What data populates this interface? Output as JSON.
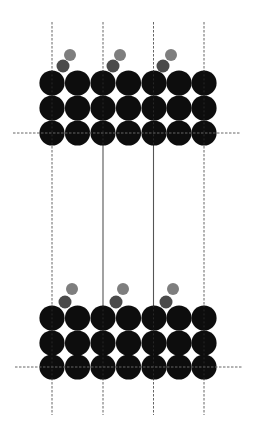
{
  "diagram": {
    "title": "",
    "colors": {
      "background": "#ffffff",
      "substrate_atom": "#0d0d0d",
      "adsorbate_lower": "#4a4a4a",
      "adsorbate_upper": "#7e7e7e",
      "solid_line": "#555555",
      "dashed_line": "#666666"
    },
    "grid": {
      "columns_x": [
        52,
        77.5,
        103,
        128.5,
        154,
        179,
        204
      ],
      "atom_radius": 12.6
    },
    "slabs": [
      {
        "name": "top-slab",
        "rows_y": [
          83,
          108,
          133
        ],
        "horizontal_line": {
          "y": 133,
          "x1": 13,
          "x2": 240,
          "style": "dashed"
        },
        "adsorbates": [
          {
            "lower": {
              "cx": 63,
              "cy": 66,
              "r": 6.5
            },
            "upper": {
              "cx": 70,
              "cy": 55,
              "r": 6
            }
          },
          {
            "lower": {
              "cx": 113,
              "cy": 66,
              "r": 6.5
            },
            "upper": {
              "cx": 120,
              "cy": 55,
              "r": 6
            }
          },
          {
            "lower": {
              "cx": 163,
              "cy": 66,
              "r": 6.5
            },
            "upper": {
              "cx": 171,
              "cy": 55,
              "r": 6
            }
          }
        ]
      },
      {
        "name": "bottom-slab",
        "rows_y": [
          318,
          343,
          367
        ],
        "horizontal_line": {
          "y": 367,
          "x1": 15,
          "x2": 242,
          "style": "dashed"
        },
        "adsorbates": [
          {
            "lower": {
              "cx": 65,
              "cy": 302,
              "r": 6.5
            },
            "upper": {
              "cx": 72,
              "cy": 289,
              "r": 6
            }
          },
          {
            "lower": {
              "cx": 116,
              "cy": 302,
              "r": 6.5
            },
            "upper": {
              "cx": 123,
              "cy": 289,
              "r": 6
            }
          },
          {
            "lower": {
              "cx": 166,
              "cy": 302,
              "r": 6.5
            },
            "upper": {
              "cx": 173,
              "cy": 289,
              "r": 6
            }
          }
        ]
      }
    ],
    "vertical_lines": [
      {
        "x": 52,
        "y1": 22,
        "y2": 415,
        "style": "dashed",
        "segments": "dashed throughout"
      },
      {
        "x": 103,
        "y1": 22,
        "y2": 415,
        "style": "mixed",
        "solid_from": 145,
        "solid_to": 306
      },
      {
        "x": 153.5,
        "y1": 22,
        "y2": 415,
        "style": "mixed",
        "solid_from": 145,
        "solid_to": 306
      },
      {
        "x": 204,
        "y1": 22,
        "y2": 415,
        "style": "dashed",
        "segments": "dashed throughout"
      }
    ]
  }
}
